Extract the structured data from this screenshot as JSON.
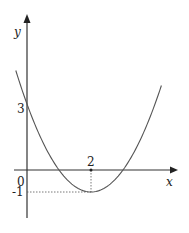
{
  "chart_data": {
    "type": "line",
    "title": "",
    "function": "y = (x - 2)^2 - 1",
    "xlabel": "x",
    "ylabel": "y",
    "origin_label": "0",
    "annotations": {
      "y_intercept": {
        "x": 0,
        "y": 3,
        "label": "3"
      },
      "vertex": {
        "x": 2,
        "y": -1,
        "x_label": "2",
        "y_label": "-1"
      }
    },
    "x": [
      -0.35,
      0,
      0.5,
      1,
      1.5,
      2,
      2.5,
      3,
      3.5,
      4,
      4.2
    ],
    "values": [
      4.52,
      3,
      1.25,
      0,
      -0.75,
      -1,
      -0.75,
      0,
      1.25,
      3,
      3.84
    ],
    "grid": false
  },
  "labels": {
    "y_axis": "y",
    "x_axis": "x",
    "origin": "0",
    "three": "3",
    "two": "2",
    "minus_one": "-1"
  }
}
